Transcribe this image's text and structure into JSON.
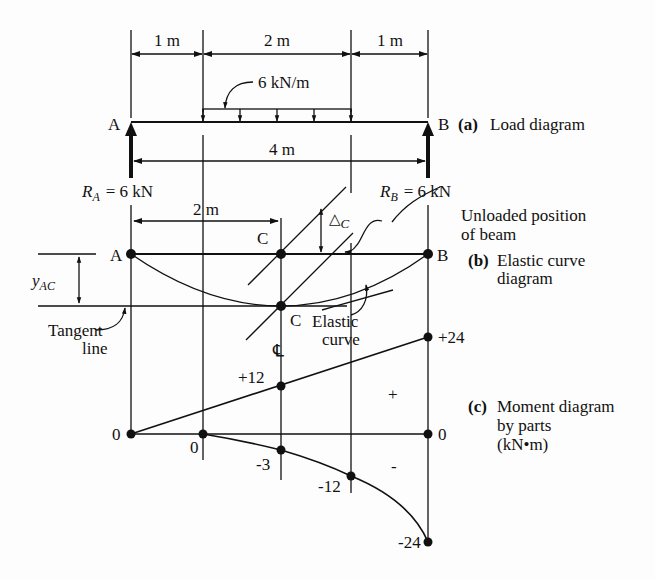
{
  "figure": {
    "dimensions": {
      "span_1": "1 m",
      "span_2": "2 m",
      "span_3": "1 m",
      "total": "4 m",
      "half": "2 m"
    },
    "load": {
      "intensity": "6 kN/m"
    },
    "supports": {
      "left": "A",
      "right": "B",
      "reaction_left_symbol": "R",
      "reaction_left_sub": "A",
      "reaction_left_value": "= 6 kN",
      "reaction_right_symbol": "R",
      "reaction_right_sub": "B",
      "reaction_right_value": "= 6 kN"
    },
    "panel_a": {
      "tag": "(a)",
      "title": "Load diagram"
    },
    "panel_b": {
      "tag": "(b)",
      "title_line1": "Elastic curve",
      "title_line2": "diagram",
      "point_a": "A",
      "point_b": "B",
      "point_c_top": "C",
      "point_c_bottom": "C",
      "delta_symbol": "△",
      "delta_sub": "C",
      "y_label": "y",
      "y_sub": "AC",
      "unloaded_line1": "Unloaded position",
      "unloaded_line2": "of beam",
      "tangent_line1": "Tangent",
      "tangent_line2": "line",
      "elastic_line1": "Elastic",
      "elastic_line2": "curve",
      "centerline": "℄"
    },
    "panel_c": {
      "tag": "(c)",
      "title_line1": "Moment diagram",
      "title_line2": "by parts",
      "title_line3": "(kN•m)",
      "labels": {
        "zero_left": "0",
        "zero_mid": "0",
        "zero_right": "0",
        "plus_12": "+12",
        "plus_24": "+24",
        "minus_3": "-3",
        "minus_12": "-12",
        "minus_24": "-24",
        "plus_sign": "+",
        "minus_sign": "-"
      }
    }
  }
}
